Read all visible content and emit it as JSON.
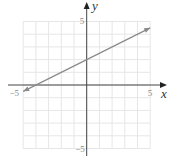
{
  "chart_data": {
    "type": "line",
    "title": "",
    "xlabel": "x",
    "ylabel": "y",
    "xlim": [
      -5,
      5
    ],
    "ylim": [
      -5,
      5
    ],
    "grid": true,
    "grid_step": 1,
    "tick_labels": {
      "x": [
        {
          "value": -5,
          "label": "−5"
        },
        {
          "value": 5,
          "label": "5"
        }
      ],
      "y": [
        {
          "value": 5,
          "label": "5"
        },
        {
          "value": -5,
          "label": "−5"
        }
      ]
    },
    "series": [
      {
        "name": "line",
        "equation": "y = 0.5x + 2",
        "slope": 0.5,
        "intercept": 2,
        "x": [
          -5,
          5
        ],
        "y": [
          -0.5,
          4.5
        ],
        "arrows": "both"
      }
    ],
    "colors": {
      "grid": "#e6e6e6",
      "axis": "#444444",
      "line": "#8a8a8a"
    }
  }
}
